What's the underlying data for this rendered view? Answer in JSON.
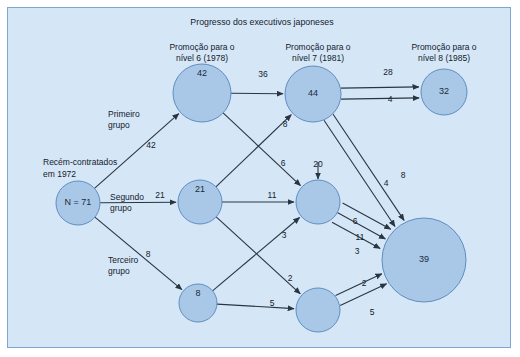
{
  "figure": {
    "title": "Progresso dos executivos japoneses",
    "background_color": "#d5e7f7",
    "border_color": "#7ea6cf",
    "node_fill": "#a9c8e8",
    "node_stroke": "#5f8cc0",
    "edge_color": "#2a3542"
  },
  "columns": [
    {
      "id": "col-nivel6",
      "line1": "Promoção para o",
      "line2": "nível 6 (1978)"
    },
    {
      "id": "col-nivel7",
      "line1": "Promoção para o",
      "line2": "nível 7 (1981)"
    },
    {
      "id": "col-nivel8",
      "line1": "Promoção para o",
      "line2": "nível 8 (1985)"
    }
  ],
  "source": {
    "line1": "Recém-contratados",
    "line2": "em 1972",
    "value": "N = 71"
  },
  "groups": [
    {
      "id": "group-1",
      "line1": "Primeiro",
      "line2": "grupo",
      "count": "42"
    },
    {
      "id": "group-2",
      "line1": "Segundo",
      "line2": "grupo",
      "count": "21"
    },
    {
      "id": "group-3",
      "line1": "Terceiro",
      "line2": "grupo",
      "count": "8"
    }
  ],
  "chart_data": {
    "type": "diagram",
    "title": "Progresso dos executivos japoneses",
    "nodes": [
      {
        "id": "n71",
        "label": "N = 71",
        "value": 71,
        "cx": 78,
        "cy": 203,
        "r": 22
      },
      {
        "id": "n42",
        "label": "42",
        "value": 42,
        "cx": 202,
        "cy": 93,
        "r": 29
      },
      {
        "id": "n21",
        "label": "21",
        "value": 21,
        "cx": 200,
        "cy": 202,
        "r": 22
      },
      {
        "id": "n8",
        "label": "8",
        "value": 8,
        "cx": 198,
        "cy": 303,
        "r": 19
      },
      {
        "id": "n44",
        "label": "44",
        "value": 44,
        "cx": 313,
        "cy": 94,
        "r": 28
      },
      {
        "id": "n20",
        "label": "",
        "value": 20,
        "cx": 318,
        "cy": 202,
        "r": 22
      },
      {
        "id": "nbot",
        "label": "",
        "value": null,
        "cx": 318,
        "cy": 310,
        "r": 22
      },
      {
        "id": "n32",
        "label": "32",
        "value": 32,
        "cx": 444,
        "cy": 92,
        "r": 23
      },
      {
        "id": "n39",
        "label": "39",
        "value": 39,
        "cx": 424,
        "cy": 260,
        "r": 42
      }
    ],
    "edges": [
      {
        "from": "n71",
        "to": "n42",
        "label": "42",
        "lx": 151,
        "ly": 148
      },
      {
        "from": "n71",
        "to": "n21",
        "label": "21",
        "lx": 160,
        "ly": 198
      },
      {
        "from": "n71",
        "to": "n8",
        "label": "8",
        "lx": 148,
        "ly": 257
      },
      {
        "from": "n42",
        "to": "n44",
        "label": "36",
        "lx": 263,
        "ly": 77
      },
      {
        "from": "n42",
        "to": "n20",
        "label": "6",
        "lx": 283,
        "ly": 166
      },
      {
        "from": "n21",
        "to": "n44",
        "label": "8",
        "lx": 285,
        "ly": 127
      },
      {
        "from": "n21",
        "to": "n20",
        "label": "11",
        "lx": 272,
        "ly": 198
      },
      {
        "from": "n21",
        "to": "nbot",
        "label": "2",
        "lx": 290,
        "ly": 281
      },
      {
        "from": "n8",
        "to": "n20",
        "label": "3",
        "lx": 284,
        "ly": 238
      },
      {
        "from": "n8",
        "to": "nbot",
        "label": "5",
        "lx": 272,
        "ly": 306
      },
      {
        "from": "n44",
        "to": "n32",
        "label": "28",
        "lx": 388,
        "ly": 75
      },
      {
        "from": "n44",
        "to": "n32",
        "label": "4",
        "lx": 390,
        "ly": 102
      },
      {
        "from": "n44",
        "to": "n39",
        "label": "4",
        "lx": 386,
        "ly": 186
      },
      {
        "from": "n44",
        "to": "n39",
        "label": "8",
        "lx": 403,
        "ly": 178
      },
      {
        "from": "n20",
        "to": "n39",
        "label": "6",
        "lx": 355,
        "ly": 224
      },
      {
        "from": "n20",
        "to": "n39",
        "label": "11",
        "lx": 360,
        "ly": 240
      },
      {
        "from": "n20",
        "to": "n39",
        "label": "3",
        "lx": 357,
        "ly": 254
      },
      {
        "from": "nbot",
        "to": "n39",
        "label": "2",
        "lx": 364,
        "ly": 286
      },
      {
        "from": "nbot",
        "to": "n39",
        "label": "5",
        "lx": 372,
        "ly": 315
      },
      {
        "from": "n20",
        "to": "n20",
        "label": "20",
        "lx": 318,
        "ly": 167
      }
    ]
  }
}
